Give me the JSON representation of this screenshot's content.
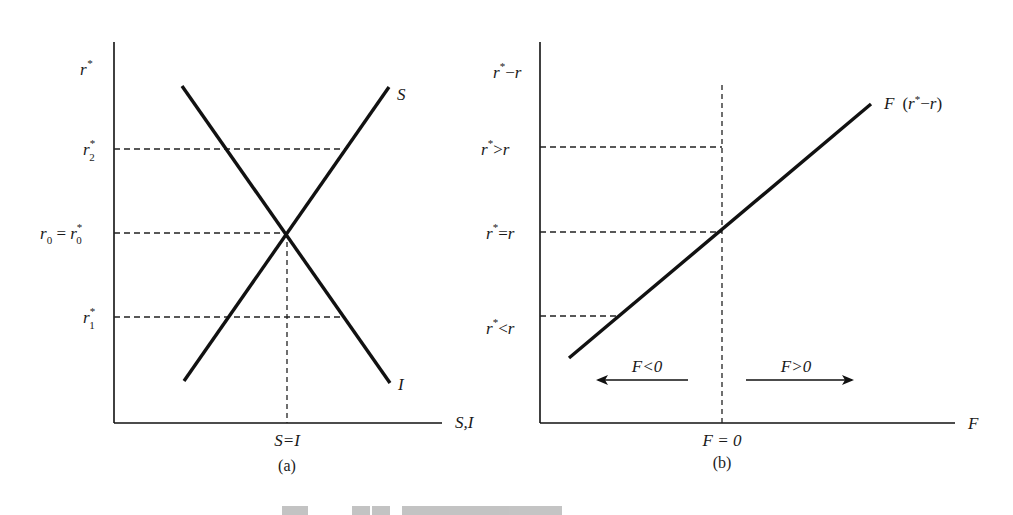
{
  "figure": {
    "panel_a": {
      "caption": "(a)",
      "y_axis_label": "r*",
      "x_axis_label": "S,I",
      "y_ticks": [
        {
          "id": "r2",
          "label": "r₂*",
          "y": 149
        },
        {
          "id": "r0",
          "label": "r₀ = r₀*",
          "y": 233
        },
        {
          "id": "r1",
          "label": "r₁*",
          "y": 317
        }
      ],
      "x_tick": {
        "label": "S=I"
      },
      "curves": [
        {
          "name": "S",
          "label": "S",
          "description": "saving curve, upward sloping"
        },
        {
          "name": "I",
          "label": "I",
          "description": "investment curve, downward sloping"
        }
      ]
    },
    "panel_b": {
      "caption": "(b)",
      "y_axis_label": "r*−r",
      "x_axis_label": "F",
      "y_ticks": [
        {
          "id": "gt",
          "label": "r*>r",
          "y": 149
        },
        {
          "id": "eq",
          "label": "r*=r",
          "y": 233
        },
        {
          "id": "lt",
          "label": "r*<r",
          "y": 317
        }
      ],
      "x_tick": {
        "label": "F = 0"
      },
      "curve": {
        "name": "F",
        "label": "F (r*−r)",
        "description": "capital flow function, upward sloping"
      },
      "arrows": [
        {
          "direction": "left",
          "label": "F<0"
        },
        {
          "direction": "right",
          "label": "F>0"
        }
      ]
    },
    "caption_partial": "图 … （底部图注被裁剪）"
  }
}
